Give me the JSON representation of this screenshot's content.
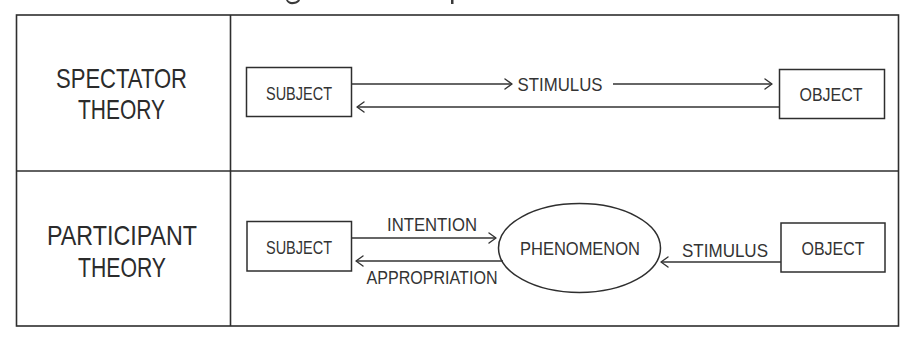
{
  "figure": {
    "rows": [
      {
        "id": "spectator",
        "label_line1": "SPECTATOR",
        "label_line2": "THEORY",
        "nodes": {
          "subject": "SUBJECT",
          "object": "OBJECT"
        },
        "edges": {
          "subject_to_object": "STIMULUS",
          "object_to_subject": ""
        }
      },
      {
        "id": "participant",
        "label_line1": "PARTICIPANT",
        "label_line2": "THEORY",
        "nodes": {
          "subject": "SUBJECT",
          "phenomenon": "PHENOMENON",
          "object": "OBJECT"
        },
        "edges": {
          "subject_to_phenomenon": "INTENTION",
          "phenomenon_to_subject": "APPROPRIATION",
          "object_to_phenomenon": "STIMULUS"
        }
      }
    ],
    "colors": {
      "line": "#2e2e2e",
      "text": "#333333",
      "background": "#ffffff"
    }
  }
}
